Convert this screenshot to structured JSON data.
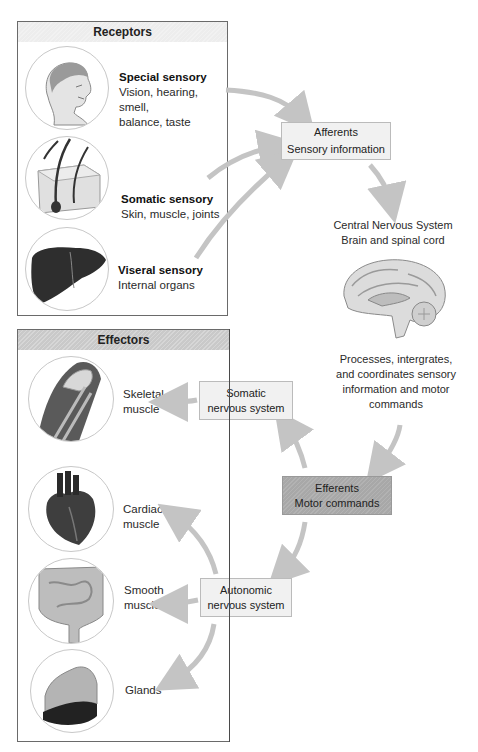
{
  "receptors": {
    "title": "Receptors",
    "items": [
      {
        "title": "Special sensory",
        "line1": "Vision, hearing, smell,",
        "line2": "balance, taste",
        "icon": "head-icon"
      },
      {
        "title": "Somatic sensory",
        "line1": "Skin, muscle, joints",
        "icon": "skin-icon"
      },
      {
        "title": "Viseral sensory",
        "line1": "Internal organs",
        "icon": "liver-icon"
      }
    ]
  },
  "afferents": {
    "line1": "Afferents",
    "line2": "Sensory information"
  },
  "cns": {
    "line1": "Central Nervous System",
    "line2": "Brain and spinal cord",
    "desc": [
      "Processes, intergrates,",
      "and coordinates sensory",
      "information and motor",
      "commands"
    ]
  },
  "efferents": {
    "line1": "Efferents",
    "line2": "Motor commands"
  },
  "somatic_ns": {
    "line1": "Somatic",
    "line2": "nervous system"
  },
  "autonomic_ns": {
    "line1": "Autonomic",
    "line2": "nervous system"
  },
  "effectors": {
    "title": "Effectors",
    "items": [
      {
        "line1": "Skeletal",
        "line2": "muscle",
        "icon": "shoulder-muscle-icon"
      },
      {
        "line1": "Cardiac",
        "line2": "muscle",
        "icon": "heart-icon"
      },
      {
        "line1": "Smooth",
        "line2": "muscle",
        "icon": "intestine-icon"
      },
      {
        "line1": "Glands",
        "icon": "gland-icon"
      }
    ]
  },
  "colors": {
    "arrow": "#c4c4c4",
    "efferent_box": "#a8a8a8",
    "box_light": "#f1f1f1",
    "effectors_header": "#c9c9c9",
    "receptors_header": "#ededed"
  }
}
